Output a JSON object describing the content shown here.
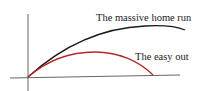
{
  "figure": {
    "labels": {
      "home_run": "The massive home run",
      "easy_out": "The easy out"
    },
    "colors": {
      "axes": "#555555",
      "home_run_curve": "#1a1a1a",
      "easy_out_curve": "#b02a2a",
      "text": "#1a1a1a"
    }
  }
}
